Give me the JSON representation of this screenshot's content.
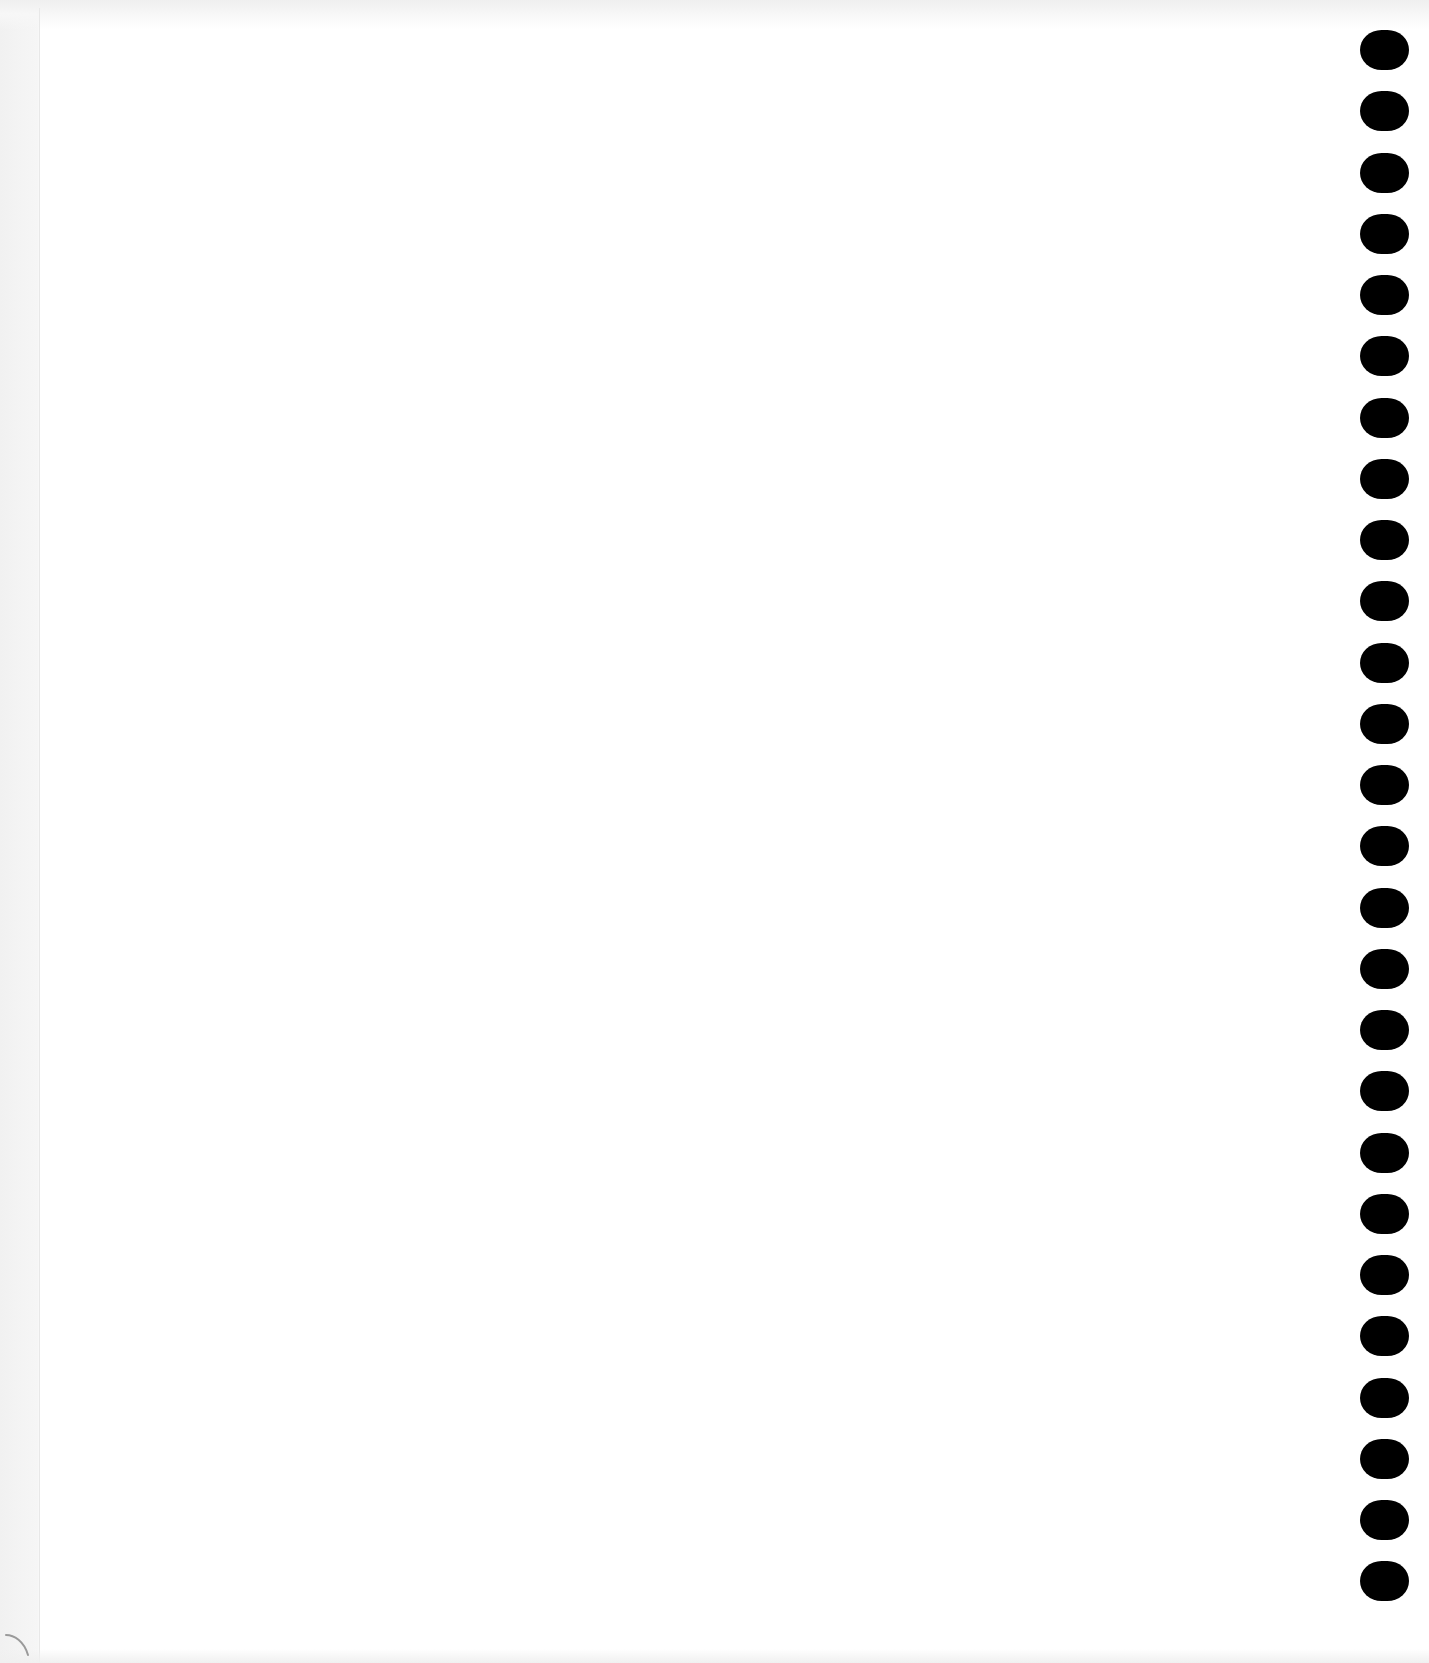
{
  "page": {
    "type": "blank spiral notebook sheet",
    "background_color": "#ffffff",
    "text_content": []
  },
  "binding": {
    "side": "right",
    "hole_count": 26,
    "hole_color": "#000000",
    "first_hole_top": 30,
    "hole_pitch": 61.25
  },
  "marks": {
    "bottom_left_curl": "paper-curl-mark"
  }
}
